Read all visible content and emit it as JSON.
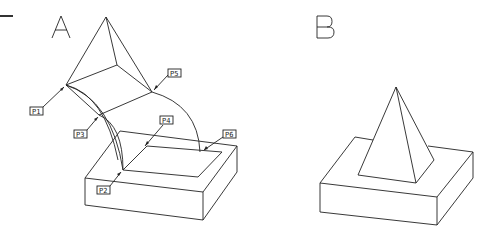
{
  "views": [
    {
      "id": "A",
      "label": "A"
    },
    {
      "id": "B",
      "label": "B"
    }
  ],
  "points": [
    {
      "label": "P1",
      "box": [
        30,
        107
      ]
    },
    {
      "label": "P2",
      "box": [
        97,
        186
      ]
    },
    {
      "label": "P3",
      "box": [
        74,
        130
      ]
    },
    {
      "label": "P4",
      "box": [
        160,
        116
      ]
    },
    {
      "label": "P5",
      "box": [
        168,
        69
      ]
    },
    {
      "label": "P6",
      "box": [
        223,
        130
      ]
    }
  ]
}
